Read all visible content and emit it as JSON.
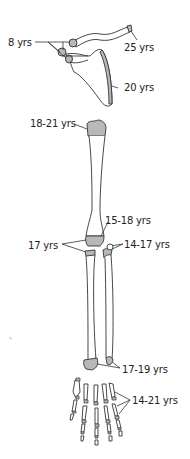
{
  "diagram": {
    "colors": {
      "outline": "#333333",
      "epiphysis_fill": "#b8b8b8",
      "background": "#ffffff"
    },
    "labels": [
      {
        "id": "scapula-coracoid-acromion",
        "text": "8 yrs"
      },
      {
        "id": "clavicle-sternal-end",
        "text": "25 yrs"
      },
      {
        "id": "scapula-vertebral-border",
        "text": "20 yrs"
      },
      {
        "id": "humerus-proximal",
        "text": "18-21 yrs"
      },
      {
        "id": "humerus-distal",
        "text": "15-18 yrs"
      },
      {
        "id": "elbow-medial-epicondyle",
        "text": "17 yrs"
      },
      {
        "id": "radius-head",
        "text": "14-17 yrs"
      },
      {
        "id": "radius-ulna-distal",
        "text": "17-19 yrs"
      },
      {
        "id": "hand-phalanges-metacarpals",
        "text": "14-21 yrs"
      }
    ]
  }
}
